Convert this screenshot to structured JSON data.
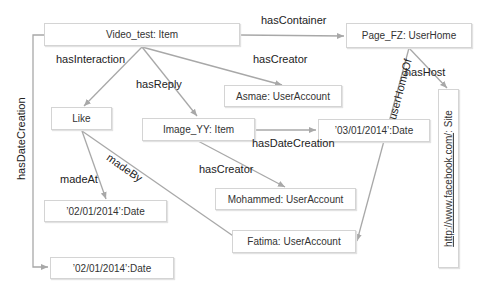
{
  "nodes": {
    "video_test": "Video_test: Item",
    "page_fz": "Page_FZ: UserHome",
    "asmae": "Asmae: UserAccount",
    "like": "Like",
    "image_yy": "Image_YY: Item",
    "date_0301": "’03/01/2014’:Date",
    "mohammed": "Mohammed: UserAccount",
    "fatima": "Fatima: UserAccount",
    "date_0201_a": "’02/01/2014’:Date",
    "date_0201_b": "’02/01/2014’:Date",
    "site_url": "http://www.facebook.com/",
    "site_type": ": Site"
  },
  "edges": {
    "hasContainer": "hasContainer",
    "hasInteraction": "hasInteraction",
    "hasCreator_video": "hasCreator",
    "hasReply": "hasReply",
    "hasDateCreation_image": "hasDateCreation",
    "hasCreator_image": "hasCreator",
    "madeAt": "madeAt",
    "madeBy": "madeBy",
    "userHomeOf": "userHomeOf",
    "hasHost": "hasHost",
    "hasDateCreation_video": "hasDateCreation"
  },
  "colors": {
    "edge": "#a8a8a8",
    "node_border": "#d4d4d4"
  }
}
